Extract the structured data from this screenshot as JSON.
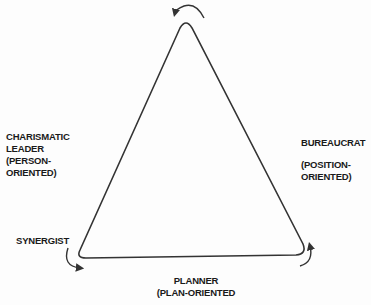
{
  "diagram": {
    "type": "triangle-cycle",
    "colors": {
      "line": "#333333",
      "text": "#1a1a1a",
      "background": "#fdfdfd"
    },
    "nodes": {
      "left": {
        "lines": [
          "CHARISMATIC",
          "LEADER",
          "(PERSON-",
          "ORIENTED)"
        ]
      },
      "right": {
        "lines": [
          "BUREAUCRAT",
          "",
          "(POSITION-",
          "ORIENTED)"
        ]
      },
      "bottom_left": {
        "label": "SYNERGIST"
      },
      "bottom": {
        "lines": [
          "PLANNER",
          "(PLAN-ORIENTED"
        ]
      }
    },
    "arrows": [
      "top-counterclockwise",
      "bottom-left-counterclockwise",
      "bottom-right-counterclockwise"
    ]
  }
}
